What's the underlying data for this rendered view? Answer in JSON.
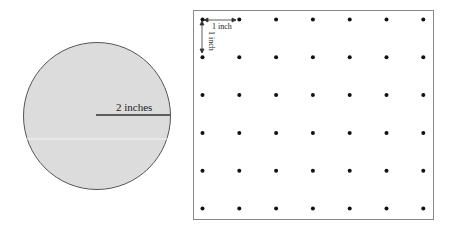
{
  "circle": {
    "radius_label": "2 inches",
    "fill": "#dcdcdc",
    "stroke": "#555555"
  },
  "grid": {
    "rows": 6,
    "cols": 7,
    "spacing_label_h": "1 inch",
    "spacing_label_v": "1 inch",
    "dot_color": "#111111",
    "border_color": "#888888"
  }
}
